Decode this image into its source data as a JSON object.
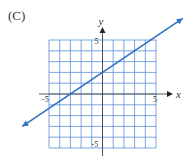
{
  "panel_label": "(C)",
  "chart_data": {
    "type": "line",
    "title": "",
    "xlabel": "x",
    "ylabel": "y",
    "xlim": [
      -5,
      5
    ],
    "ylim": [
      -5,
      5
    ],
    "grid": true,
    "grid_step": 1,
    "x_tick_labels": [
      "-5",
      "5"
    ],
    "y_tick_labels": [
      "5",
      "-5"
    ],
    "series": [
      {
        "name": "line",
        "equation": "y = (2/3)x + 2",
        "slope": 0.6667,
        "intercept": 2,
        "x": [
          -7.5,
          7.5
        ],
        "y": [
          -3,
          7
        ],
        "arrows": "both",
        "color": "#2f6fc4"
      }
    ],
    "grid_color": "#5b8fd6"
  }
}
